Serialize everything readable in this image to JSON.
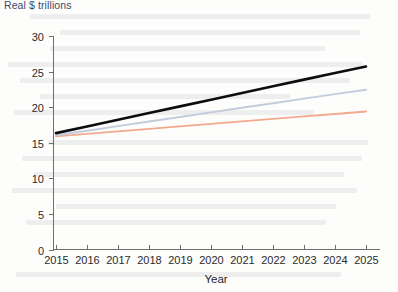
{
  "chart_data": {
    "type": "line",
    "title": "Real $ trillions",
    "subtitle": "",
    "xlabel": "Year",
    "ylabel": "",
    "xlim": [
      2015,
      2025
    ],
    "ylim": [
      0,
      30
    ],
    "grid": false,
    "legend_position": "none",
    "x": [
      2015,
      2016,
      2017,
      2018,
      2019,
      2020,
      2021,
      2022,
      2023,
      2024,
      2025
    ],
    "xticklabels": [
      "2015",
      "2016",
      "2017",
      "2018",
      "2019",
      "2020",
      "2021",
      "2022",
      "2023",
      "2024",
      "2025"
    ],
    "yticks": [
      0,
      5,
      10,
      15,
      20,
      25,
      30
    ],
    "yticklabels": [
      "0",
      "5",
      "10",
      "15",
      "20",
      "25",
      "30"
    ],
    "series": [
      {
        "name": "high-growth",
        "color": "#0d0d0d",
        "width": 2.6,
        "values": [
          16.35,
          17.29,
          18.23,
          19.17,
          20.11,
          21.05,
          21.99,
          22.93,
          23.87,
          24.81,
          25.7
        ]
      },
      {
        "name": "mid-growth",
        "color": "#c3cbdd",
        "width": 1.9,
        "values": [
          16.05,
          16.69,
          17.34,
          17.98,
          18.62,
          19.27,
          19.91,
          20.55,
          21.2,
          21.84,
          22.45
        ]
      },
      {
        "name": "low-growth",
        "color": "#f3a98e",
        "width": 1.9,
        "values": [
          15.9,
          16.25,
          16.6,
          16.95,
          17.3,
          17.65,
          18.0,
          18.35,
          18.7,
          19.05,
          19.4
        ]
      }
    ]
  },
  "background_bleed": {
    "description": "faint reversed text showing through scanned page"
  }
}
